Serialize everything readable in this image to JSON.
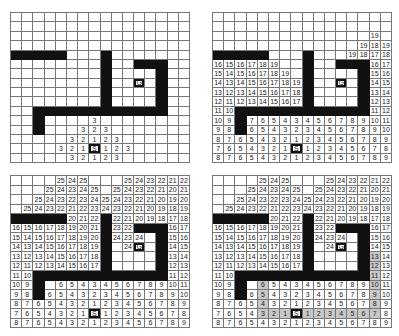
{
  "legend": {
    "wall": "W",
    "empty": ".",
    "start": "S",
    "goal": "G"
  },
  "colors": {
    "wall": "#111111",
    "grid_line": "#777777",
    "path_highlight": "#c8c8c8",
    "background": "#ffffff"
  },
  "grid": {
    "columns": 16,
    "rows": 16
  },
  "panels": [
    {
      "id": "top-left",
      "description": "Breadth-first expansion from S, step 3",
      "rows": [
        ". . . . . . . . . . . . . . . .",
        ". . . . . . . . . . . . . . . .",
        ". . . . . . . . . . . . . . . .",
        ". . . . . . . . . . . . . . . .",
        "W W W W W . . . W . . . . . . .",
        ". . . . . . . . W . . W W W . .",
        ". . . . . . . . W . . . . W . .",
        ". . . . . . . . W . . G . W . .",
        ". . . . . . . . W . . . . W . .",
        ". . . . . . . . W . . . . W . .",
        ". . W W W W W W W W W W W W . .",
        ". . W . . . . 3 . . . . . . . .",
        ". . W . . . 3 2 3 . . . . . . .",
        ". . . . . 3 2 1 2 3 . . . . . .",
        ". . . . 3 2 1 S 1 2 3 . . . . .",
        ". . . . . 3 2 1 2 3 . . . . . ."
      ],
      "path": []
    },
    {
      "id": "top-right",
      "description": "Breadth-first expansion, step 19",
      "rows": [
        ". . . . . . . . . . . . . . . .",
        ". . . . . . . . . . . . . . . .",
        ". . . . . . . . . . . . . . 19 .",
        ". . . . . . . . . . . . . 19 18 19",
        "W W W W W . . . W . . . 19 18 17 18",
        "16 15 16 17 18 19 . . W . . W W W 16 17",
        "15 14 15 16 17 18 19 . W . . . . W 15 16",
        "14 13 14 15 16 17 18 19 W . . G . W 14 15",
        "13 12 13 14 15 16 17 18 W . . . . W 13 14",
        "12 11 12 13 14 15 16 17 W . . . . W 12 13",
        "11 10 W W W W W W W W W W W W 11 12",
        "10 9 W 7 6 5 4 3 4 5 6 7 8 9 10 11",
        "9 8 W 6 5 4 3 2 3 4 5 6 7 8 9 10",
        "8 7 6 5 4 3 2 1 2 3 4 5 6 7 8 9",
        "7 6 5 4 3 2 1 S 1 2 3 4 5 6 7 8",
        "8 7 6 5 4 3 2 1 2 3 4 5 6 7 8 9"
      ],
      "path": []
    },
    {
      "id": "bottom-left",
      "description": "Breadth-first expansion reaching goal, step 25",
      "rows": [
        ". . . . 25 24 25 . . . 25 24 23 22 21 22",
        ". . . 25 24 23 24 25 . 25 24 23 22 21 20 21",
        ". . 25 24 23 22 23 24 25 24 23 22 21 20 19 20",
        ". 25 24 23 22 21 22 23 24 23 22 21 20 19 18 19",
        "W W W W W 20 21 22 W 22 21 20 19 18 17 18",
        "16 15 16 17 18 19 20 21 W 23 22 W W W 16 17",
        "15 14 15 16 17 18 19 20 W 24 23 24 . W 15 16",
        "14 13 14 15 16 17 18 19 W . 24 G . W 14 15",
        "13 12 13 14 15 16 17 18 W . . . . W 13 14",
        "12 11 12 13 14 15 16 17 W . . . . W 12 13",
        "11 10 W W W W W W W W W W W W 11 12",
        "10 9 W . 6 5 4 3 4 5 6 7 8 9 10 11",
        "9 8 W 6 5 4 3 2 3 4 5 6 7 8 9 10",
        "8 7 6 5 4 3 2 1 2 3 4 5 6 7 8 9",
        "7 6 5 4 3 2 1 S 1 2 3 4 5 6 7 8",
        "8 7 6 5 4 3 2 1 2 3 4 5 6 7 8 9"
      ],
      "path": []
    },
    {
      "id": "bottom-right",
      "description": "Shortest path traced back from G to S (highlighted)",
      "rows": [
        ". . . . 25 24 25 . . . 25 24 23 22 21 22",
        ". . . 25 24 23 24 25 . 25 24 23 22 21 20 21",
        ". . 25 24 23 22 23 24 25 24 23 22 21 20 19 20",
        ". 25 24 23 22 21 22 23 24 23 22 21 20 19 18 19",
        "W W W W W 20 21 22 W 22 21 20 19 18 17 18",
        "16 15 16 17 18 19 20 21 W 23 22 W W W 16 17",
        "15 14 15 16 17 18 19 20 W 24 23 24 . W 15 16",
        "14 13 14 15 16 17 18 19 W . 24 G . W 14 15",
        "13 12 13 14 15 16 17 18 W . . . . W 13 14",
        "12 11 12 13 14 15 16 17 W . . . . W 12 13",
        "11 10 W W W W W W W W W W W W 11 12",
        "10 9 W . 6 5 4 3 4 5 6 7 8 9 10 11",
        "9 8 W 6 5 4 3 2 3 4 5 6 7 8 9 10",
        "8 7 6 5 4 3 2 1 2 3 4 5 6 7 8 9",
        "7 6 5 4 3 2 1 S 1 2 3 4 5 6 7 8",
        "8 7 6 5 4 3 2 1 2 3 4 5 6 7 8 9"
      ],
      "path": [
        [
          8,
          10
        ],
        [
          7,
          10
        ],
        [
          6,
          10
        ],
        [
          5,
          10
        ],
        [
          4,
          10
        ],
        [
          4,
          11
        ],
        [
          4,
          12
        ],
        [
          4,
          13
        ],
        [
          4,
          14
        ],
        [
          5,
          14
        ],
        [
          6,
          14
        ],
        [
          7,
          14
        ],
        [
          8,
          14
        ],
        [
          9,
          14
        ],
        [
          10,
          14
        ],
        [
          11,
          14
        ],
        [
          12,
          14
        ],
        [
          13,
          14
        ],
        [
          14,
          14
        ],
        [
          14,
          13
        ],
        [
          14,
          12
        ],
        [
          14,
          11
        ],
        [
          14,
          10
        ],
        [
          14,
          9
        ],
        [
          14,
          8
        ]
      ]
    }
  ]
}
